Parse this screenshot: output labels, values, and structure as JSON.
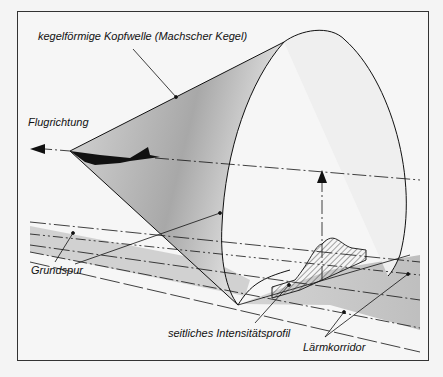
{
  "diagram": {
    "labels": {
      "cone": "kegelförmige Kopfwelle (Machscher Kegel)",
      "direction": "Flugrichtung",
      "ground_track": "Grundspur",
      "profile": "seitliches Intensitätsprofil",
      "corridor": "Lärmkorridor"
    },
    "colors": {
      "line": "#111111",
      "border": "#333333",
      "background": "#f4f4f4",
      "shade": "#9a9a9a"
    }
  }
}
